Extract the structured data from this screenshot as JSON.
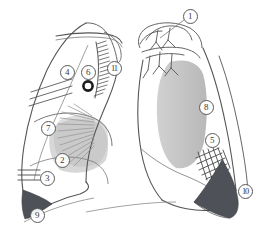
{
  "figure": {
    "width": 262,
    "height": 244,
    "background_color": "#ffffff",
    "outline_color": "#4a4a4a",
    "shading_color": "#b9b9b9",
    "dense_shading_color": "#4e5157",
    "marker_text_color": "#3a3a3a"
  },
  "panels": [
    {
      "name": "left-lung-panel",
      "label": "Left lateral lung view",
      "position": "left"
    },
    {
      "name": "right-lung-panel",
      "label": "Right lateral lung view",
      "position": "right"
    }
  ],
  "markers": [
    {
      "id": "1",
      "label": "①",
      "text": "1",
      "x": 190,
      "y": 16,
      "panel": "right-lung-panel",
      "has_leader": true
    },
    {
      "id": "2",
      "label": "②",
      "text": "2",
      "x": 62,
      "y": 160,
      "panel": "left-lung-panel",
      "has_leader": false
    },
    {
      "id": "3",
      "label": "③",
      "text": "3",
      "x": 47,
      "y": 178,
      "panel": "left-lung-panel",
      "has_leader": false
    },
    {
      "id": "4",
      "label": "④",
      "text": "4",
      "x": 67,
      "y": 72,
      "panel": "left-lung-panel",
      "has_leader": false
    },
    {
      "id": "5",
      "label": "⑤",
      "text": "5",
      "x": 212,
      "y": 140,
      "panel": "right-lung-panel",
      "has_leader": false
    },
    {
      "id": "6",
      "label": "⑥",
      "text": "6",
      "x": 88,
      "y": 72,
      "panel": "left-lung-panel",
      "has_leader": false
    },
    {
      "id": "7",
      "label": "⑦",
      "text": "7",
      "x": 48,
      "y": 128,
      "panel": "left-lung-panel",
      "has_leader": false
    },
    {
      "id": "8",
      "label": "⑧",
      "text": "8",
      "x": 206,
      "y": 107,
      "panel": "right-lung-panel",
      "has_leader": false
    },
    {
      "id": "9",
      "label": "⑨",
      "text": "9",
      "x": 37,
      "y": 215,
      "panel": "left-lung-panel",
      "has_leader": false
    },
    {
      "id": "10",
      "label": "⑩",
      "text": "10",
      "x": 245,
      "y": 191,
      "panel": "right-lung-panel",
      "has_leader": false
    },
    {
      "id": "11",
      "label": "⑪",
      "text": "11",
      "x": 114,
      "y": 68,
      "panel": "left-lung-panel",
      "has_leader": false
    }
  ]
}
